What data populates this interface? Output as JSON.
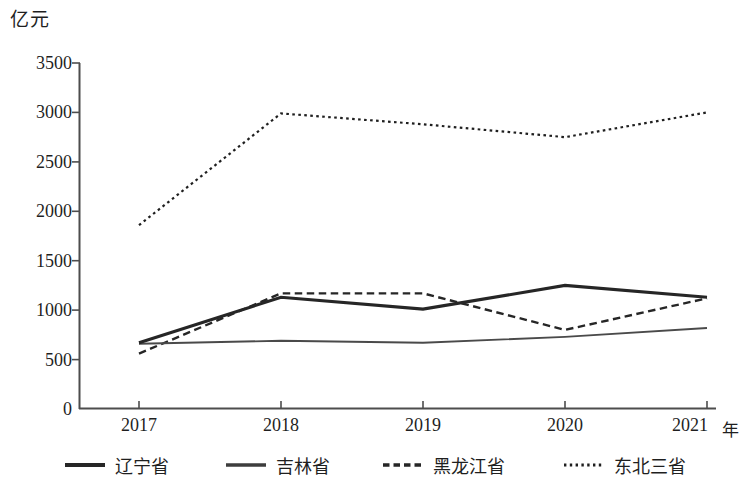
{
  "chart_data": {
    "type": "line",
    "title": "",
    "xlabel": "年",
    "ylabel": "亿元",
    "x": [
      "2017",
      "2018",
      "2019",
      "2020",
      "2021"
    ],
    "categories": [
      "2017",
      "2018",
      "2019",
      "2020",
      "2021"
    ],
    "ylim": [
      0,
      3500
    ],
    "ytick_step": 500,
    "yticks": [
      "0",
      "500",
      "1000",
      "1500",
      "2000",
      "2500",
      "3000",
      "3500"
    ],
    "grid": false,
    "legend_position": "bottom",
    "series": [
      {
        "name": "辽宁省",
        "style": "solid-thick",
        "color": "#262626",
        "values": [
          670,
          1130,
          1010,
          1250,
          1130
        ]
      },
      {
        "name": "吉林省",
        "style": "solid-thin",
        "color": "#4a4a4a",
        "values": [
          660,
          690,
          670,
          730,
          820
        ]
      },
      {
        "name": "黑龙江省",
        "style": "dashed",
        "color": "#262626",
        "values": [
          560,
          1170,
          1170,
          800,
          1120
        ]
      },
      {
        "name": "东北三省",
        "style": "dotted",
        "color": "#1f1f1f",
        "values": [
          1860,
          2990,
          2880,
          2750,
          3000
        ]
      }
    ]
  },
  "axes": {
    "y_unit": "亿元",
    "x_unit": "年",
    "axis_color": "#4d4d4d"
  },
  "legend": {
    "items": [
      {
        "label": "辽宁省",
        "style": "solid-thick"
      },
      {
        "label": "吉林省",
        "style": "solid-thin"
      },
      {
        "label": "黑龙江省",
        "style": "dashed"
      },
      {
        "label": "东北三省",
        "style": "dotted"
      }
    ]
  }
}
